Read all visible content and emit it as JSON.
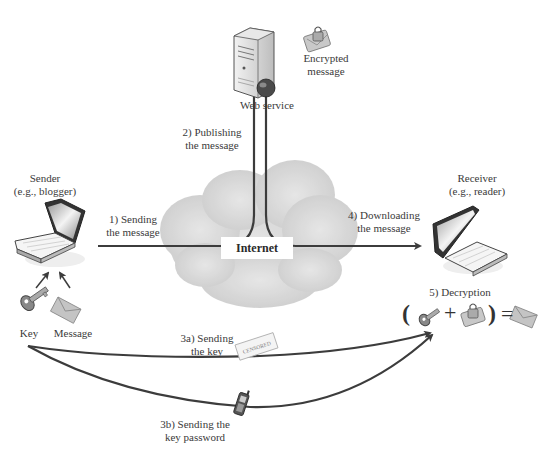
{
  "diagram": {
    "type": "encrypted-blog-message-flow",
    "nodes": {
      "web_service": {
        "label": "Web service"
      },
      "encrypted_message": {
        "label_line1": "Encrypted",
        "label_line2": "message"
      },
      "sender": {
        "label_line1": "Sender",
        "label_line2": "(e.g., blogger)"
      },
      "receiver": {
        "label_line1": "Receiver",
        "label_line2": "(e.g., reader)"
      },
      "internet": {
        "label": "Internet"
      },
      "key": {
        "label": "Key"
      },
      "message": {
        "label": "Message"
      }
    },
    "steps": {
      "s1": {
        "line1": "1) Sending",
        "line2": "the message"
      },
      "s2": {
        "line1": "2) Publishing",
        "line2": "the message"
      },
      "s3a": {
        "line1": "3a) Sending",
        "line2": "the key"
      },
      "s3b": {
        "line1": "3b) Sending the",
        "line2": "key password"
      },
      "s4": {
        "line1": "4) Downloading",
        "line2": "the message"
      },
      "s5": {
        "label": "5) Decryption"
      }
    },
    "decryption_equation": {
      "open_paren": "(",
      "plus": "+",
      "close_paren": ")",
      "equals": "="
    },
    "censored_stamp": "CENSORED"
  },
  "colors": {
    "line": "#3c3c3c",
    "cloud": "#d9d9d9",
    "text": "#3a3a3a"
  }
}
